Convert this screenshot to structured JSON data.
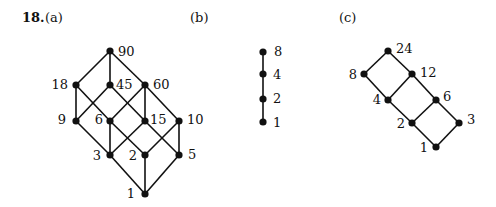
{
  "problem": {
    "number": "18.",
    "parts": [
      "(a)",
      "(b)",
      "(c)"
    ]
  },
  "diagrams": [
    {
      "id": "a",
      "label": "(a)",
      "nodes": [
        {
          "v": "90",
          "x": 110,
          "y": 51,
          "lx": 118,
          "ly": 56,
          "anchor": "start"
        },
        {
          "v": "18",
          "x": 76,
          "y": 85,
          "lx": 68,
          "ly": 89,
          "anchor": "end"
        },
        {
          "v": "45",
          "x": 110,
          "y": 85,
          "lx": 116,
          "ly": 89,
          "anchor": "start"
        },
        {
          "v": "60",
          "x": 145,
          "y": 85,
          "lx": 153,
          "ly": 89,
          "anchor": "start"
        },
        {
          "v": "9",
          "x": 76,
          "y": 121,
          "lx": 66,
          "ly": 124,
          "anchor": "end"
        },
        {
          "v": "6",
          "x": 110,
          "y": 121,
          "lx": 103,
          "ly": 124,
          "anchor": "end"
        },
        {
          "v": "15",
          "x": 145,
          "y": 121,
          "lx": 150,
          "ly": 124,
          "anchor": "start"
        },
        {
          "v": "10",
          "x": 179,
          "y": 121,
          "lx": 187,
          "ly": 124,
          "anchor": "start"
        },
        {
          "v": "3",
          "x": 110,
          "y": 155,
          "lx": 101,
          "ly": 160,
          "anchor": "end"
        },
        {
          "v": "2",
          "x": 145,
          "y": 155,
          "lx": 137,
          "ly": 160,
          "anchor": "end"
        },
        {
          "v": "5",
          "x": 179,
          "y": 155,
          "lx": 188,
          "ly": 159,
          "anchor": "start"
        },
        {
          "v": "1",
          "x": 145,
          "y": 194,
          "lx": 135,
          "ly": 198,
          "anchor": "end"
        }
      ],
      "edges": [
        [
          "90",
          "18"
        ],
        [
          "90",
          "45"
        ],
        [
          "90",
          "60"
        ],
        [
          "18",
          "9"
        ],
        [
          "18",
          "6"
        ],
        [
          "45",
          "9"
        ],
        [
          "45",
          "15"
        ],
        [
          "60",
          "6"
        ],
        [
          "60",
          "15"
        ],
        [
          "60",
          "10"
        ],
        [
          "9",
          "3"
        ],
        [
          "6",
          "3"
        ],
        [
          "6",
          "2"
        ],
        [
          "15",
          "3"
        ],
        [
          "15",
          "5"
        ],
        [
          "10",
          "2"
        ],
        [
          "10",
          "5"
        ],
        [
          "3",
          "1"
        ],
        [
          "2",
          "1"
        ],
        [
          "5",
          "1"
        ]
      ]
    },
    {
      "id": "b",
      "label": "(b)",
      "nodes": [
        {
          "v": "8",
          "x": 263,
          "y": 52,
          "lx": 274,
          "ly": 56,
          "anchor": "start"
        },
        {
          "v": "4",
          "x": 263,
          "y": 74,
          "lx": 273,
          "ly": 79,
          "anchor": "start"
        },
        {
          "v": "2",
          "x": 263,
          "y": 99,
          "lx": 273,
          "ly": 103,
          "anchor": "start"
        },
        {
          "v": "1",
          "x": 263,
          "y": 122,
          "lx": 273,
          "ly": 127,
          "anchor": "start"
        }
      ],
      "edges": [
        [
          "8",
          "4"
        ],
        [
          "4",
          "2"
        ],
        [
          "2",
          "1"
        ]
      ]
    },
    {
      "id": "c",
      "label": "(c)",
      "nodes": [
        {
          "v": "24",
          "x": 388,
          "y": 51,
          "lx": 396,
          "ly": 53,
          "anchor": "start"
        },
        {
          "v": "8",
          "x": 364,
          "y": 74,
          "lx": 357,
          "ly": 79,
          "anchor": "end"
        },
        {
          "v": "12",
          "x": 412,
          "y": 74,
          "lx": 420,
          "ly": 77,
          "anchor": "start"
        },
        {
          "v": "4",
          "x": 388,
          "y": 100,
          "lx": 381,
          "ly": 104,
          "anchor": "end"
        },
        {
          "v": "6",
          "x": 436,
          "y": 100,
          "lx": 443,
          "ly": 101,
          "anchor": "start"
        },
        {
          "v": "2",
          "x": 412,
          "y": 123,
          "lx": 405,
          "ly": 128,
          "anchor": "end"
        },
        {
          "v": "3",
          "x": 459,
          "y": 123,
          "lx": 467,
          "ly": 124,
          "anchor": "start"
        },
        {
          "v": "1",
          "x": 436,
          "y": 147,
          "lx": 428,
          "ly": 152,
          "anchor": "end"
        }
      ],
      "edges": [
        [
          "24",
          "8"
        ],
        [
          "24",
          "12"
        ],
        [
          "8",
          "4"
        ],
        [
          "12",
          "4"
        ],
        [
          "12",
          "6"
        ],
        [
          "4",
          "2"
        ],
        [
          "6",
          "2"
        ],
        [
          "6",
          "3"
        ],
        [
          "2",
          "1"
        ],
        [
          "3",
          "1"
        ]
      ]
    }
  ]
}
